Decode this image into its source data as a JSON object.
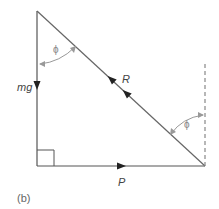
{
  "diagram": {
    "panel_label": "(b)",
    "forces": {
      "weight": "mg",
      "reaction": "R",
      "push": "P"
    },
    "angles": {
      "top": "ϕ",
      "right": "ϕ"
    },
    "colors": {
      "lines": "#555555",
      "angle_arcs": "#999999",
      "dashed": "#888888"
    }
  }
}
